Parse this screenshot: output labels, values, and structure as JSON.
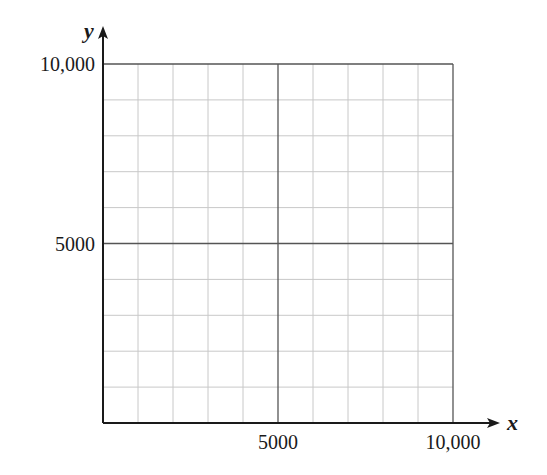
{
  "chart_data": {
    "type": "line",
    "title": "",
    "xlabel": "x",
    "ylabel": "y",
    "xlim": [
      0,
      10000
    ],
    "ylim": [
      0,
      10000
    ],
    "x_ticks": [
      {
        "value": 5000,
        "label": "5000"
      },
      {
        "value": 10000,
        "label": "10,000"
      }
    ],
    "y_ticks": [
      {
        "value": 5000,
        "label": "5000"
      },
      {
        "value": 10000,
        "label": "10,000"
      }
    ],
    "grid": true,
    "minor_grid_step": 1000,
    "major_grid_step": 5000,
    "series": [],
    "colors": {
      "axis": "#1a1a1a",
      "major_grid": "#555555",
      "minor_grid": "#c8c8c8"
    }
  }
}
